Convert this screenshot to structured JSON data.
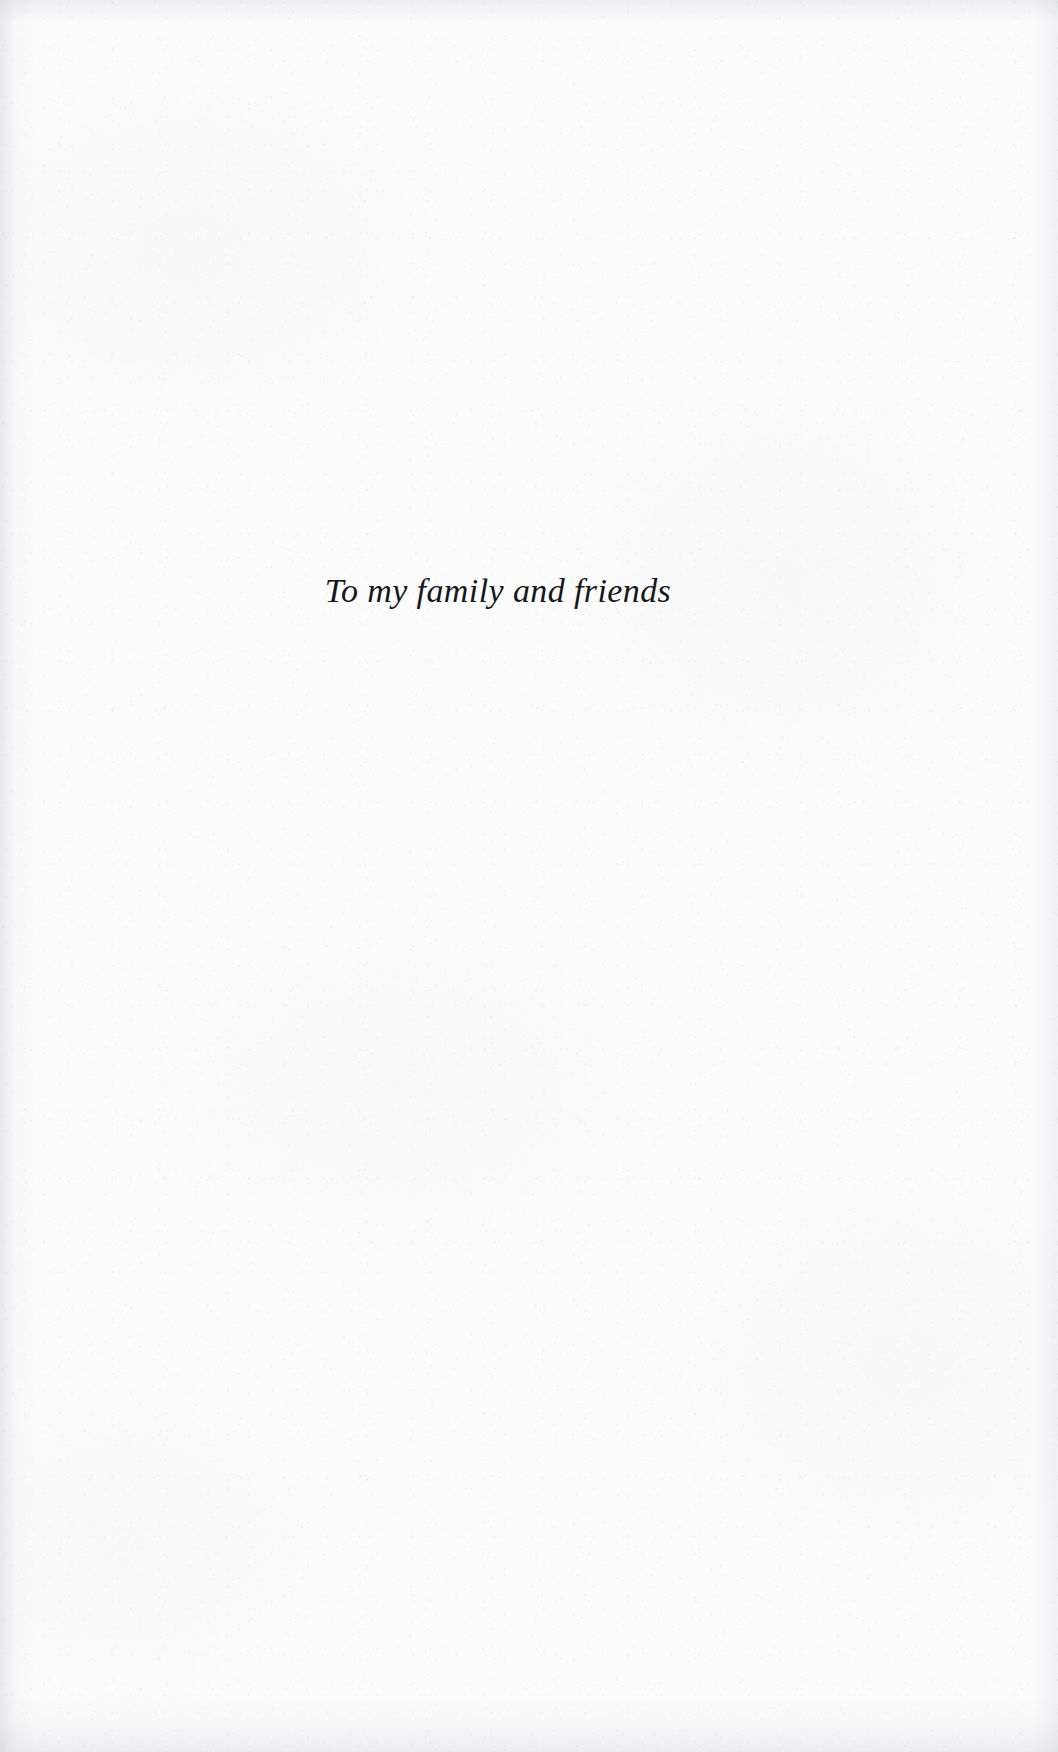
{
  "page": {
    "kind": "book-dedication-page",
    "paper_color": "#fcfcfd",
    "ink_color": "#17171a",
    "width_px": 1058,
    "height_px": 1752
  },
  "dedication": {
    "text": "To my family and friends"
  }
}
